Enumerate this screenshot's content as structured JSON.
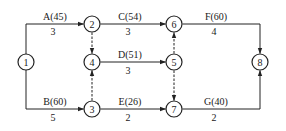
{
  "diagram": {
    "type": "activity-on-arrow network",
    "colors": {
      "line": "#222222",
      "background": "#ffffff"
    },
    "nodes": [
      {
        "id": "1",
        "label": "1",
        "x": 26,
        "y": 62
      },
      {
        "id": "2",
        "label": "2",
        "x": 92,
        "y": 24
      },
      {
        "id": "3",
        "label": "3",
        "x": 92,
        "y": 109
      },
      {
        "id": "4",
        "label": "4",
        "x": 92,
        "y": 62
      },
      {
        "id": "5",
        "label": "5",
        "x": 174,
        "y": 62
      },
      {
        "id": "6",
        "label": "6",
        "x": 174,
        "y": 24
      },
      {
        "id": "7",
        "label": "7",
        "x": 174,
        "y": 109
      },
      {
        "id": "8",
        "label": "8",
        "x": 260,
        "y": 62
      }
    ],
    "activities": [
      {
        "name": "A(45)",
        "duration": "3",
        "from": "1",
        "to": "2"
      },
      {
        "name": "B(60)",
        "duration": "5",
        "from": "1",
        "to": "3"
      },
      {
        "name": "C(54)",
        "duration": "3",
        "from": "2",
        "to": "6"
      },
      {
        "name": "D(51)",
        "duration": "3",
        "from": "4",
        "to": "5"
      },
      {
        "name": "E(26)",
        "duration": "2",
        "from": "3",
        "to": "7"
      },
      {
        "name": "F(60)",
        "duration": "4",
        "from": "6",
        "to": "8"
      },
      {
        "name": "G(40)",
        "duration": "2",
        "from": "7",
        "to": "8"
      }
    ],
    "dummies": [
      {
        "from": "2",
        "to": "4"
      },
      {
        "from": "3",
        "to": "4"
      },
      {
        "from": "5",
        "to": "6"
      },
      {
        "from": "5",
        "to": "7"
      }
    ]
  }
}
